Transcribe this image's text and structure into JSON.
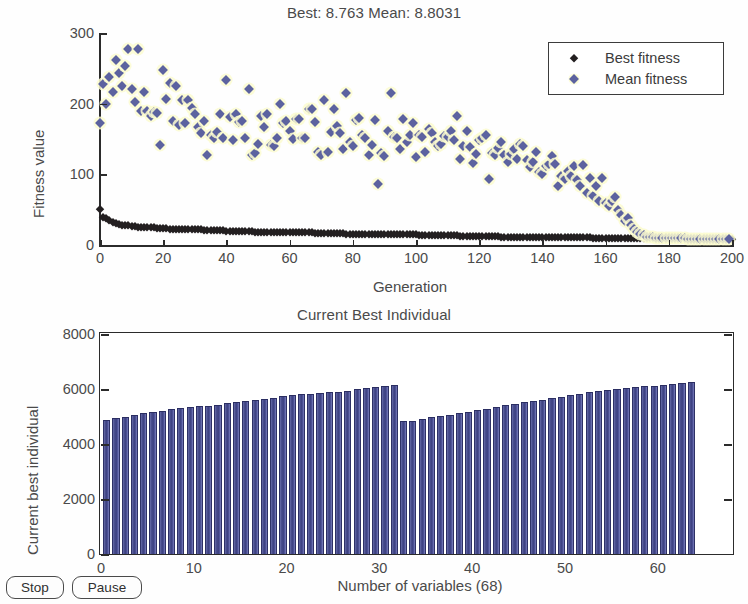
{
  "window": {
    "title": "Genetic Algorithm Plots"
  },
  "buttons": [
    {
      "name": "stop-button",
      "label": "Stop"
    },
    {
      "name": "pause-button",
      "label": "Pause"
    }
  ],
  "colors": {
    "best_marker": "#231f20",
    "mean_marker": "#5c629f",
    "mean_halo": "#fbfbd0",
    "bar_fill": "#3c4080",
    "axis": "#2b2b2b",
    "text": "#4a4a4a",
    "background": "#ffffff"
  },
  "chart_data": [
    {
      "type": "scatter",
      "id": "fitness-plot",
      "title": "Best: 8.763 Mean: 8.8031",
      "best_value": 8.763,
      "mean_value": 8.8031,
      "xlabel": "Generation",
      "ylabel": "Fitness value",
      "xlim": [
        0,
        200
      ],
      "ylim": [
        0,
        300
      ],
      "xticks": [
        0,
        20,
        40,
        60,
        80,
        100,
        120,
        140,
        160,
        180,
        200
      ],
      "yticks": [
        0,
        100,
        200,
        300
      ],
      "grid": false,
      "legend": {
        "position": "top-right",
        "entries": [
          "Best fitness",
          "Mean fitness"
        ]
      },
      "series": [
        {
          "name": "Best fitness",
          "marker": "diamond",
          "color": "#231f20",
          "x": [
            0,
            1,
            2,
            3,
            4,
            5,
            6,
            7,
            8,
            9,
            10,
            11,
            12,
            13,
            14,
            15,
            16,
            17,
            18,
            19,
            20,
            21,
            22,
            23,
            24,
            25,
            26,
            27,
            28,
            29,
            30,
            31,
            32,
            33,
            34,
            35,
            36,
            37,
            38,
            39,
            40,
            41,
            42,
            43,
            44,
            45,
            46,
            47,
            48,
            49,
            50,
            51,
            52,
            53,
            54,
            55,
            56,
            57,
            58,
            59,
            60,
            61,
            62,
            63,
            64,
            65,
            66,
            67,
            68,
            69,
            70,
            71,
            72,
            73,
            74,
            75,
            76,
            77,
            78,
            79,
            80,
            81,
            82,
            83,
            84,
            85,
            86,
            87,
            88,
            89,
            90,
            91,
            92,
            93,
            94,
            95,
            96,
            97,
            98,
            99,
            100,
            101,
            102,
            103,
            104,
            105,
            106,
            107,
            108,
            109,
            110,
            111,
            112,
            113,
            114,
            115,
            116,
            117,
            118,
            119,
            120,
            121,
            122,
            123,
            124,
            125,
            126,
            127,
            128,
            129,
            130,
            131,
            132,
            133,
            134,
            135,
            136,
            137,
            138,
            139,
            140,
            141,
            142,
            143,
            144,
            145,
            146,
            147,
            148,
            149,
            150,
            151,
            152,
            153,
            154,
            155,
            156,
            157,
            158,
            159,
            160,
            161,
            162,
            163,
            164,
            165,
            166,
            167,
            168,
            169,
            170,
            171,
            172,
            173,
            174,
            175,
            176,
            177,
            178,
            179,
            180,
            181,
            182,
            183,
            184,
            185,
            186,
            187,
            188,
            189,
            190,
            191,
            192,
            193,
            194,
            195,
            196,
            197,
            198,
            199,
            200
          ],
          "y": [
            51,
            40,
            38,
            36,
            33,
            31,
            30,
            29,
            28,
            28,
            27,
            27,
            26,
            26,
            26,
            25,
            25,
            25,
            24,
            24,
            24,
            24,
            23,
            23,
            23,
            23,
            23,
            22,
            22,
            22,
            22,
            22,
            22,
            21,
            21,
            21,
            21,
            21,
            21,
            21,
            20,
            20,
            20,
            20,
            20,
            20,
            20,
            20,
            20,
            19,
            19,
            19,
            19,
            19,
            19,
            19,
            19,
            19,
            18,
            18,
            18,
            18,
            18,
            18,
            18,
            18,
            18,
            18,
            17,
            17,
            17,
            17,
            17,
            17,
            17,
            17,
            17,
            17,
            16,
            16,
            16,
            16,
            16,
            16,
            16,
            16,
            16,
            16,
            16,
            15,
            15,
            15,
            15,
            15,
            15,
            15,
            15,
            15,
            15,
            15,
            15,
            14,
            14,
            14,
            14,
            14,
            14,
            14,
            14,
            14,
            14,
            14,
            14,
            14,
            13,
            13,
            13,
            13,
            13,
            13,
            13,
            13,
            13,
            13,
            13,
            13,
            13,
            12,
            12,
            12,
            12,
            12,
            12,
            12,
            12,
            12,
            12,
            12,
            12,
            12,
            12,
            12,
            11,
            11,
            11,
            11,
            11,
            11,
            11,
            11,
            11,
            11,
            11,
            11,
            11,
            11,
            10,
            10,
            10,
            10,
            10,
            10,
            10,
            10,
            10,
            10,
            10,
            10,
            10,
            10,
            10,
            9.8,
            9.7,
            9.6,
            9.5,
            9.4,
            9.3,
            9.2,
            9.15,
            9.1,
            9.05,
            9.0,
            8.98,
            8.95,
            8.93,
            8.9,
            8.88,
            8.86,
            8.84,
            8.82,
            8.81,
            8.8,
            8.79,
            8.78,
            8.775,
            8.77,
            8.768,
            8.766,
            8.765,
            8.764,
            8.763,
            8.763,
            8.763
          ]
        },
        {
          "name": "Mean fitness",
          "marker": "diamond",
          "color": "#5c629f",
          "x": [
            0,
            1,
            2,
            3,
            4,
            5,
            6,
            7,
            8,
            9,
            10,
            11,
            12,
            13,
            14,
            15,
            16,
            17,
            18,
            19,
            20,
            21,
            22,
            23,
            24,
            25,
            26,
            27,
            28,
            29,
            30,
            31,
            32,
            33,
            34,
            35,
            36,
            37,
            38,
            39,
            40,
            41,
            42,
            43,
            44,
            45,
            46,
            47,
            48,
            49,
            50,
            51,
            52,
            53,
            54,
            55,
            56,
            57,
            58,
            59,
            60,
            61,
            62,
            63,
            64,
            65,
            66,
            67,
            68,
            69,
            70,
            71,
            72,
            73,
            74,
            75,
            76,
            77,
            78,
            79,
            80,
            81,
            82,
            83,
            84,
            85,
            86,
            87,
            88,
            89,
            90,
            91,
            92,
            93,
            94,
            95,
            96,
            97,
            98,
            99,
            100,
            101,
            102,
            103,
            104,
            105,
            106,
            107,
            108,
            109,
            110,
            111,
            112,
            113,
            114,
            115,
            116,
            117,
            118,
            119,
            120,
            121,
            122,
            123,
            124,
            125,
            126,
            127,
            128,
            129,
            130,
            131,
            132,
            133,
            134,
            135,
            136,
            137,
            138,
            139,
            140,
            141,
            142,
            143,
            144,
            145,
            146,
            147,
            148,
            149,
            150,
            151,
            152,
            153,
            154,
            155,
            156,
            157,
            158,
            159,
            160,
            161,
            162,
            163,
            164,
            165,
            166,
            167,
            168,
            169,
            170,
            171,
            172,
            173,
            174,
            175,
            176,
            177,
            178,
            179,
            180,
            181,
            182,
            183,
            184,
            185,
            186,
            187,
            188,
            189,
            190,
            191,
            192,
            193,
            194,
            195,
            196,
            197,
            198,
            199,
            200
          ],
          "y": [
            172,
            228,
            199,
            238,
            217,
            262,
            243,
            225,
            253,
            277,
            221,
            203,
            277,
            190,
            216,
            190,
            182,
            188,
            187,
            141,
            247,
            206,
            229,
            176,
            225,
            170,
            205,
            172,
            205,
            194,
            185,
            167,
            158,
            176,
            127,
            156,
            152,
            160,
            185,
            152,
            234,
            181,
            148,
            186,
            174,
            176,
            151,
            221,
            127,
            130,
            143,
            182,
            167,
            186,
            142,
            140,
            152,
            200,
            172,
            175,
            162,
            150,
            179,
            178,
            152,
            151,
            192,
            192,
            174,
            132,
            127,
            205,
            131,
            160,
            193,
            168,
            158,
            136,
            215,
            146,
            140,
            177,
            180,
            155,
            152,
            127,
            142,
            177,
            87,
            130,
            126,
            161,
            215,
            153,
            152,
            136,
            179,
            146,
            155,
            173,
            124,
            156,
            153,
            131,
            164,
            159,
            146,
            140,
            143,
            154,
            153,
            161,
            148,
            183,
            122,
            140,
            162,
            139,
            116,
            129,
            149,
            151,
            155,
            94,
            130,
            127,
            137,
            146,
            128,
            118,
            129,
            136,
            122,
            143,
            140,
            120,
            110,
            117,
            131,
            104,
            100,
            112,
            115,
            126,
            114,
            83,
            98,
            93,
            105,
            98,
            112,
            92,
            83,
            113,
            73,
            95,
            70,
            84,
            62,
            95,
            60,
            55,
            62,
            68,
            50,
            43,
            34,
            38,
            28,
            22,
            18,
            16,
            14,
            12,
            11,
            11,
            10.5,
            10.2,
            10,
            9.8,
            9.7,
            9.6,
            9.5,
            9.4,
            9.3,
            9.2,
            9.1,
            9.05,
            9.0,
            8.95,
            8.92,
            8.9,
            8.88,
            8.86,
            8.85,
            8.84,
            8.83,
            8.82,
            8.81,
            8.8031
          ]
        }
      ]
    },
    {
      "type": "bar",
      "id": "current-best-individual-plot",
      "title": "Current Best Individual",
      "xlabel": "Number of variables (68)",
      "ylabel": "Current best individual",
      "num_variables": 68,
      "xlim": [
        0,
        68
      ],
      "ylim": [
        0,
        8000
      ],
      "xticks": [
        0,
        10,
        20,
        30,
        40,
        50,
        60
      ],
      "yticks": [
        0,
        2000,
        4000,
        6000,
        8000
      ],
      "grid": false,
      "bar_color": "#3c4080",
      "categories": [
        1,
        2,
        3,
        4,
        5,
        6,
        7,
        8,
        9,
        10,
        11,
        12,
        13,
        14,
        15,
        16,
        17,
        18,
        19,
        20,
        21,
        22,
        23,
        24,
        25,
        26,
        27,
        28,
        29,
        30,
        31,
        32,
        33,
        34,
        35,
        36,
        37,
        38,
        39,
        40,
        41,
        42,
        43,
        44,
        45,
        46,
        47,
        48,
        49,
        50,
        51,
        52,
        53,
        54,
        55,
        56,
        57,
        58,
        59,
        60,
        61,
        62,
        63,
        64
      ],
      "values": [
        4830,
        4900,
        4950,
        5020,
        5080,
        5130,
        5180,
        5230,
        5280,
        5300,
        5340,
        5360,
        5400,
        5450,
        5500,
        5540,
        5560,
        5600,
        5630,
        5700,
        5750,
        5780,
        5800,
        5820,
        5850,
        5870,
        5900,
        5950,
        6000,
        6020,
        6080,
        6120,
        4790,
        4800,
        4870,
        4930,
        4990,
        5030,
        5080,
        5140,
        5190,
        5240,
        5300,
        5380,
        5420,
        5480,
        5530,
        5570,
        5620,
        5680,
        5730,
        5790,
        5840,
        5880,
        5930,
        5950,
        5990,
        6020,
        6060,
        6090,
        6110,
        6150,
        6180,
        6220
      ]
    }
  ]
}
